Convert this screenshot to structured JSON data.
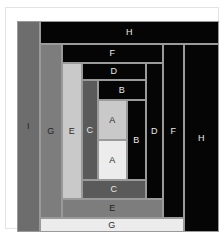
{
  "figure": {
    "background": "#ffffff",
    "canvas_background": "#000000",
    "border_color": "#e3e3e3",
    "stroke_color": "#9a9a9a"
  },
  "palette": {
    "black": "#050505",
    "dark_gray": "#5a5a5a",
    "mid_gray": "#6d6d6d",
    "mid_gray_2": "#7d7d7d",
    "light_gray": "#c9c9c9",
    "lighter_gray": "#d8d8d8",
    "lightest_gray": "#ececec"
  },
  "chart_data": {
    "type": "table",
    "xlabel": "",
    "ylabel": "",
    "categories": [
      "A",
      "A",
      "B",
      "B",
      "C",
      "C",
      "D",
      "D",
      "E",
      "E",
      "F",
      "F",
      "G",
      "G",
      "H",
      "H",
      "I"
    ],
    "values": [
      1,
      1,
      2,
      2,
      3,
      3,
      5,
      5,
      8,
      8,
      13,
      13,
      21,
      21,
      34,
      34,
      55
    ],
    "note": "Each letter labels a rectangle; letters appear as a vertical member and a horizontal member forming a spiral subdivision."
  },
  "rects": [
    {
      "id": "I-left",
      "label": "I",
      "fill": "#6d6d6d",
      "text_tone": "on-mid",
      "x": 0,
      "y": 0,
      "w": 23,
      "h": 211
    },
    {
      "id": "H-top",
      "label": "H",
      "fill": "#050505",
      "text_tone": "on-dark",
      "x": 23,
      "y": 0,
      "w": 179,
      "h": 23
    },
    {
      "id": "H-right",
      "label": "H",
      "fill": "#050505",
      "text_tone": "on-dark",
      "x": 167,
      "y": 23,
      "w": 35,
      "h": 188
    },
    {
      "id": "G-left",
      "label": "G",
      "fill": "#7d7d7d",
      "text_tone": "on-mid",
      "x": 23,
      "y": 23,
      "w": 22,
      "h": 174
    },
    {
      "id": "G-bottom",
      "label": "G",
      "fill": "#ececec",
      "text_tone": "on-light",
      "x": 23,
      "y": 197,
      "w": 144,
      "h": 14
    },
    {
      "id": "F-top",
      "label": "F",
      "fill": "#050505",
      "text_tone": "on-dark",
      "x": 45,
      "y": 23,
      "w": 101,
      "h": 19
    },
    {
      "id": "F-right",
      "label": "F",
      "fill": "#050505",
      "text_tone": "on-dark",
      "x": 146,
      "y": 23,
      "w": 21,
      "h": 174
    },
    {
      "id": "E-left",
      "label": "E",
      "fill": "#c9c9c9",
      "text_tone": "on-light",
      "x": 45,
      "y": 42,
      "w": 20,
      "h": 136
    },
    {
      "id": "E-bottom",
      "label": "E",
      "fill": "#7d7d7d",
      "text_tone": "on-mid",
      "x": 45,
      "y": 178,
      "w": 101,
      "h": 19
    },
    {
      "id": "D-top",
      "label": "D",
      "fill": "#050505",
      "text_tone": "on-dark",
      "x": 65,
      "y": 42,
      "w": 64,
      "h": 17
    },
    {
      "id": "D-right",
      "label": "D",
      "fill": "#050505",
      "text_tone": "on-dark",
      "x": 129,
      "y": 42,
      "w": 17,
      "h": 136
    },
    {
      "id": "C-left",
      "label": "C",
      "fill": "#5a5a5a",
      "text_tone": "on-dark",
      "x": 65,
      "y": 59,
      "w": 16,
      "h": 100
    },
    {
      "id": "C-bottom",
      "label": "C",
      "fill": "#5a5a5a",
      "text_tone": "on-dark",
      "x": 65,
      "y": 159,
      "w": 64,
      "h": 19
    },
    {
      "id": "B-top",
      "label": "B",
      "fill": "#050505",
      "text_tone": "on-dark",
      "x": 81,
      "y": 59,
      "w": 48,
      "h": 20
    },
    {
      "id": "B-right",
      "label": "B",
      "fill": "#050505",
      "text_tone": "on-dark",
      "x": 110,
      "y": 79,
      "w": 19,
      "h": 80
    },
    {
      "id": "A-upper",
      "label": "A",
      "fill": "#c9c9c9",
      "text_tone": "on-light",
      "x": 81,
      "y": 79,
      "w": 29,
      "h": 40
    },
    {
      "id": "A-lower",
      "label": "A",
      "fill": "#ececec",
      "text_tone": "on-light",
      "x": 81,
      "y": 119,
      "w": 29,
      "h": 40
    }
  ]
}
